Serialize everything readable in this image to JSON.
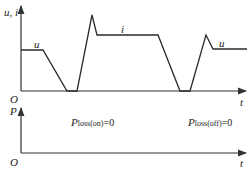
{
  "top_plot": {
    "y_axis_label": "u, i",
    "x_axis_label": "t",
    "origin_label": "O",
    "curve_labels": {
      "u_left": "u",
      "i_middle": "i",
      "u_right": "u"
    }
  },
  "bottom_plot": {
    "y_axis_label": "P",
    "x_axis_label": "t",
    "origin_label": "O",
    "annotations": {
      "on": {
        "symbol": "P",
        "subscript": "loss(on)",
        "equals": "=0"
      },
      "off": {
        "symbol": "P",
        "subscript": "loss(off)",
        "equals": "=0"
      }
    }
  },
  "colors": {
    "line": "#2a2a2a",
    "axis": "#3a3a3a"
  }
}
